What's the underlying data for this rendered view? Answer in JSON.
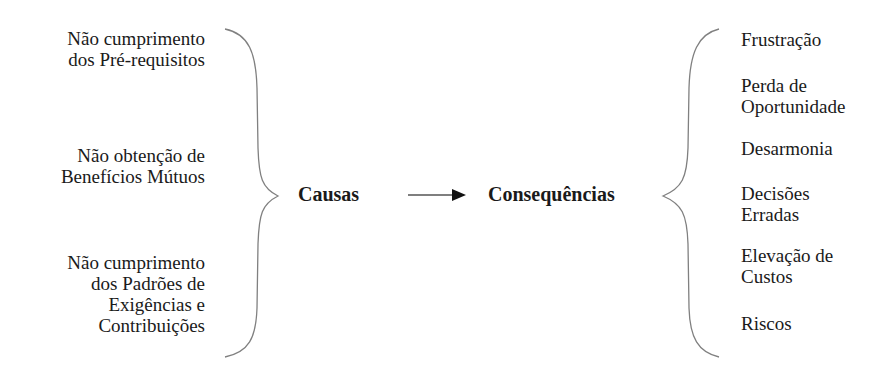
{
  "diagram": {
    "type": "cause-effect",
    "causes": [
      "Não cumprimento\ndos Pré-requisitos",
      "Não obtenção de\nBenefícios Mútuos",
      "Não cumprimento\ndos Padrões de\nExigências e\nContribuições"
    ],
    "center": {
      "causes_label": "Causas",
      "consequences_label": "Consequências"
    },
    "consequences": [
      "Frustração",
      "Perda de\nOportunidade",
      "Desarmonia",
      "Decisões\nErradas",
      "Elevação de\nCustos",
      "Riscos"
    ],
    "colors": {
      "text": "#1a1a1a",
      "brace": "#808080",
      "arrow": "#111111"
    }
  }
}
